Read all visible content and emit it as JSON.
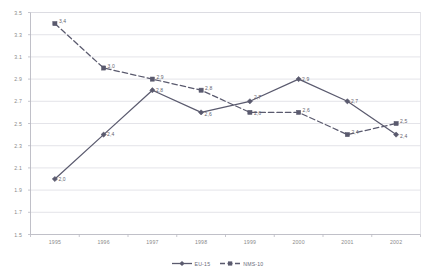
{
  "chart_data": {
    "type": "line",
    "title": "",
    "xlabel": "",
    "ylabel": "",
    "categories": [
      "1995",
      "1996",
      "1997",
      "1998",
      "1999",
      "2000",
      "2001",
      "2002"
    ],
    "ylim": [
      1.5,
      3.5
    ],
    "yticks": [
      "1.5",
      "1.7",
      "1.9",
      "2.1",
      "2.3",
      "2.5",
      "2.7",
      "2.9",
      "3.1",
      "3.3",
      "3.5"
    ],
    "grid": true,
    "legend_position": "bottom",
    "series": [
      {
        "name": "EU-15",
        "marker": "diamond",
        "line_style": "solid",
        "color": "#5a5a6e",
        "values": [
          2.0,
          2.4,
          2.8,
          2.6,
          2.7,
          2.9,
          2.7,
          2.4
        ],
        "labels": [
          "2,0",
          "2,4",
          "2,8",
          "2,6",
          "2,7",
          "2,9",
          "2,7",
          "2,4"
        ]
      },
      {
        "name": "NMS-10",
        "marker": "square",
        "line_style": "dashed",
        "color": "#5a5a6e",
        "values": [
          3.4,
          3.0,
          2.9,
          2.8,
          2.6,
          2.6,
          2.4,
          2.5
        ],
        "labels": [
          "3,4",
          "3,0",
          "2,9",
          "2,8",
          "2,6",
          "2,6",
          "2,4",
          "2,5"
        ]
      }
    ]
  },
  "colors": {
    "series": "#5a5a6e",
    "gridline": "#d9d9e0",
    "axis": "#b9b9c2",
    "tick_text": "#8a8a8a",
    "background": "#ffffff"
  },
  "legend": {
    "entries": [
      {
        "label": "EU-15"
      },
      {
        "label": "NMS-10"
      }
    ]
  }
}
